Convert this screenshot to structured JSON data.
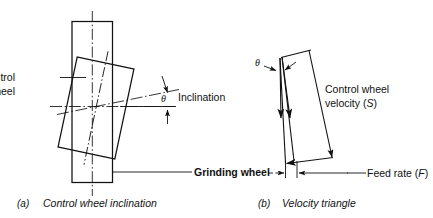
{
  "figure": {
    "background_color": "#ffffff",
    "line_color": "#111111",
    "title": ""
  },
  "panel_a": {
    "tag": "(a)",
    "caption": "Control wheel inclination",
    "labels": {
      "control_wheel_line1": "Control",
      "control_wheel_line2": "wheel",
      "grinding_wheel": "Grinding wheel",
      "inclination": "Inclination",
      "angle_symbol": "θ"
    }
  },
  "panel_b": {
    "tag": "(b)",
    "caption": "Velocity triangle",
    "labels": {
      "velocity_line1": "Control wheel",
      "velocity_line2_pre": "velocity (",
      "velocity_symbol": "S",
      "velocity_line2_post": ")",
      "feed_rate_pre": "Feed rate (",
      "feed_rate_symbol": "F",
      "feed_rate_post": ")",
      "angle_symbol": "θ"
    }
  }
}
